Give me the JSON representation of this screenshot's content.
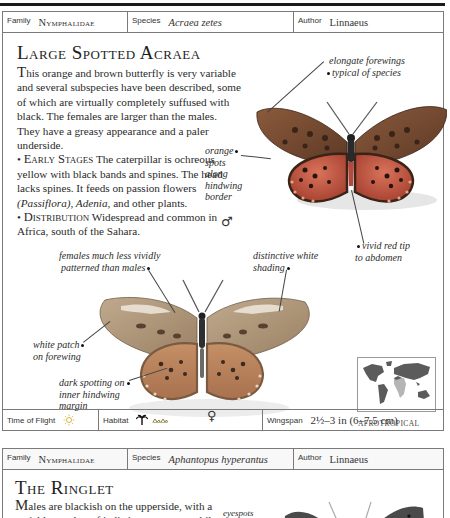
{
  "entry1": {
    "header": {
      "family_label": "Family",
      "family_value": "Nymphalidae",
      "species_label": "Species",
      "species_value": "Acraea zetes",
      "author_label": "Author",
      "author_value": "Linnaeus"
    },
    "title": "Large Spotted Acraea",
    "description": {
      "dropcap": "T",
      "intro": "his orange and brown butterfly is very variable and several subspecies have been described, some of which are virtually completely suffused with black. The females are larger than the males. They have a greasy appearance and a paler underside.",
      "early_stages_heading": "Early Stages",
      "early_stages_text_1": " The caterpillar is ochreous yellow with black bands and spines. The head lacks spines. It feeds on passion flowers ",
      "early_stages_italic_1": "(Passiflora), Adenia,",
      "early_stages_text_2": " and other plants.",
      "distribution_heading": "Distribution",
      "distribution_text": " Widespread and common in Africa, south of the Sahara."
    },
    "captions": {
      "elongate_1": "elongate forewings",
      "elongate_2": "typical of species",
      "orange_spots_1": "orange",
      "orange_spots_2": "spots",
      "orange_spots_3": "along",
      "orange_spots_4": "hindwing",
      "orange_spots_5": "border",
      "red_tip_1": "vivid red tip",
      "red_tip_2": "to abdomen",
      "females_1": "females much less vividly",
      "females_2": "patterned than males",
      "white_shading_1": "distinctive white",
      "white_shading_2": "shading",
      "white_patch_1": "white patch",
      "white_patch_2": "on forewing",
      "dark_spotting_1": "dark spotting on",
      "dark_spotting_2": "inner hindwing",
      "dark_spotting_3": "margin"
    },
    "male_symbol": "♂",
    "female_symbol": "♀",
    "map_label": "AFROTROPICAL",
    "footer": {
      "time_of_flight_label": "Time of Flight",
      "time_of_flight_icon": "sun-icon",
      "habitat_label": "Habitat",
      "habitat_icons": [
        "palm-tree-icon",
        "grassland-icon"
      ],
      "wingspan_label": "Wingspan",
      "wingspan_value": "2½–3 in (6–7.5 cm)"
    },
    "colors": {
      "male_forewing": "#7a4a2e",
      "male_hindwing": "#c9614a",
      "female_wing": "#b39a7c",
      "map_land": "#5b5b5b",
      "map_region": "#b5b5b5"
    }
  },
  "entry2": {
    "header": {
      "family_label": "Family",
      "family_value": "Nymphalidae",
      "species_label": "Species",
      "species_value": "Aphantopus hyperantus",
      "author_label": "Author",
      "author_value": "Linnaeus"
    },
    "title": "The Ringlet",
    "description": {
      "dropcap": "M",
      "line_1": "ales are blackish on the upperside, with a",
      "line_2": "variable number of indistinct eyespots, while"
    },
    "captions": {
      "eyespots": "eyespots"
    }
  }
}
